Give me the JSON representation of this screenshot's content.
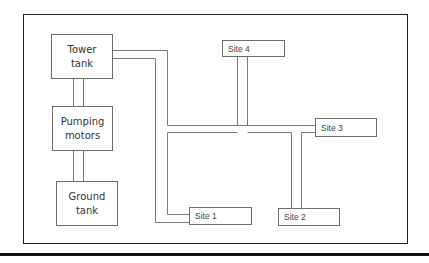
{
  "diagram": {
    "type": "water distribution schematic",
    "nodes": {
      "tower_tank": "Tower\ntank",
      "pumping_motors": "Pumping\nmotors",
      "ground_tank": "Ground\ntank",
      "site1": "Site 1",
      "site2": "Site 2",
      "site3": "Site 3",
      "site4": "Site 4"
    },
    "edges": [
      [
        "Ground tank",
        "Pumping motors"
      ],
      [
        "Pumping motors",
        "Tower tank"
      ],
      [
        "Tower tank",
        "Site 1"
      ],
      [
        "Tower tank",
        "Site 3"
      ],
      [
        "Main line",
        "Site 4"
      ],
      [
        "Main line",
        "Site 2"
      ]
    ],
    "colors": {
      "line": "#6e6e6e",
      "frame": "#222222"
    }
  }
}
